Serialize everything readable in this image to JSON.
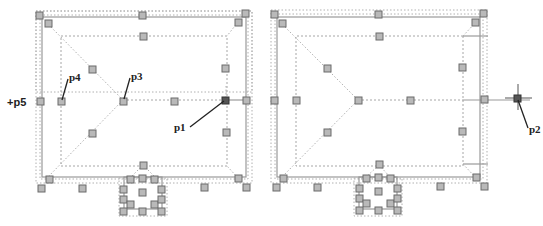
{
  "figure": {
    "panels": [
      {
        "id": "left",
        "description": "Roof outline with grips; grip p1 selected at right ridge end",
        "labels": {
          "p1": "p1",
          "p3": "p3",
          "p4": "p4",
          "p5": "+p5"
        }
      },
      {
        "id": "right",
        "description": "Roof outline after stretching ridge end to p2",
        "labels": {
          "p2": "p2"
        }
      }
    ]
  },
  "colors": {
    "grip_fill": "#b9b9b9",
    "grip_border": "#6b6b6b",
    "selected_grip": "#555555",
    "outline": "#9a9a9a",
    "dotted": "#b0b0b0",
    "leader": "#222222"
  }
}
